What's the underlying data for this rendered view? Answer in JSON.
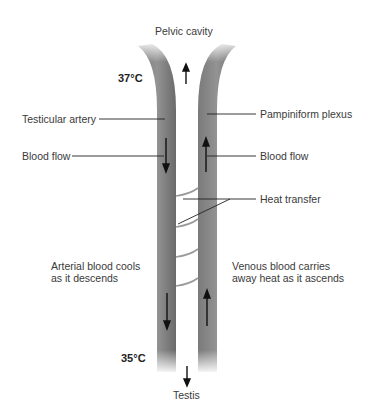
{
  "diagram": {
    "top_label": "Pelvic cavity",
    "bottom_label": "Testis",
    "temperatures": {
      "top": "37°C",
      "bottom": "35°C"
    },
    "left_labels": {
      "vessel": "Testicular artery",
      "flow": "Blood flow",
      "note_line1": "Arterial blood cools",
      "note_line2": "as it descends"
    },
    "right_labels": {
      "vessel": "Pampiniform plexus",
      "flow": "Blood flow",
      "heat": "Heat transfer",
      "note_line1": "Venous blood carries",
      "note_line2": "away heat as it ascends"
    },
    "colors": {
      "vessel": "#8a8a8a",
      "vessel_dark": "#6e6e6e",
      "arrow": "#111111",
      "leader": "#222222",
      "heat_arc": "#9a9a9a"
    }
  }
}
